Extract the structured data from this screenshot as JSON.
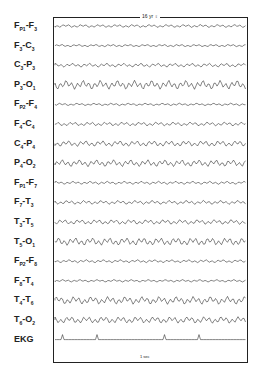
{
  "figure": {
    "title": "16 yr ♀",
    "calibration_label": "1 sec",
    "channels": [
      {
        "a": "F",
        "as": "P1",
        "b": "F",
        "bs": "3"
      },
      {
        "a": "F",
        "as": "3",
        "b": "C",
        "bs": "3"
      },
      {
        "a": "C",
        "as": "3",
        "b": "P",
        "bs": "3"
      },
      {
        "a": "P",
        "as": "3",
        "b": "O",
        "bs": "1"
      },
      {
        "a": "F",
        "as": "P2",
        "b": "F",
        "bs": "4"
      },
      {
        "a": "F",
        "as": "4",
        "b": "C",
        "bs": "4"
      },
      {
        "a": "C",
        "as": "4",
        "b": "P",
        "bs": "4"
      },
      {
        "a": "P",
        "as": "4",
        "b": "O",
        "bs": "2"
      },
      {
        "a": "F",
        "as": "P1",
        "b": "F",
        "bs": "7"
      },
      {
        "a": "F",
        "as": "7",
        "b": "T",
        "bs": "3"
      },
      {
        "a": "T",
        "as": "3",
        "b": "T",
        "bs": "5"
      },
      {
        "a": "T",
        "as": "5",
        "b": "O",
        "bs": "1"
      },
      {
        "a": "F",
        "as": "P2",
        "b": "F",
        "bs": "8"
      },
      {
        "a": "F",
        "as": "8",
        "b": "T",
        "bs": "4"
      },
      {
        "a": "T",
        "as": "4",
        "b": "T",
        "bs": "6"
      },
      {
        "a": "T",
        "as": "6",
        "b": "O",
        "bs": "2"
      },
      {
        "a": "EKG",
        "as": "",
        "b": "",
        "bs": ""
      }
    ],
    "amplitudes": [
      1.5,
      1.2,
      2,
      4.5,
      1.2,
      2,
      3,
      3.5,
      1.5,
      2,
      2.5,
      4,
      1.5,
      1.2,
      4,
      3.5,
      0
    ]
  }
}
